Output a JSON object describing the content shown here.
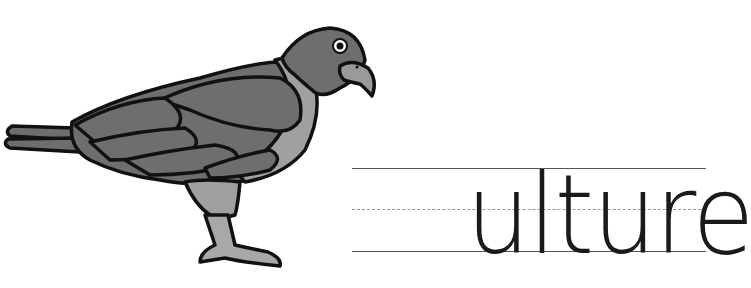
{
  "worksheet": {
    "illustration": {
      "subject": "vulture",
      "icon": "vulture-bird-icon",
      "colors": {
        "body": "#6e6e6e",
        "neck": "#a0a0a0",
        "outline": "#111111",
        "legs": "#a8a8a8"
      }
    },
    "handwriting": {
      "partial_word": "ulture",
      "guide_lines": [
        "top-solid",
        "middle-dashed",
        "bottom-solid"
      ]
    }
  }
}
